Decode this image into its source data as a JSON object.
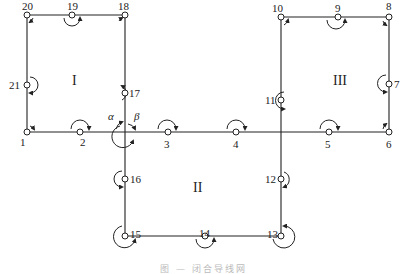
{
  "diagram": {
    "type": "closed traverse network with connection angles",
    "regions": [
      {
        "id": "I",
        "label": "I"
      },
      {
        "id": "II",
        "label": "II"
      },
      {
        "id": "III",
        "label": "III"
      }
    ],
    "points": [
      {
        "id": "1",
        "label": "1"
      },
      {
        "id": "2",
        "label": "2"
      },
      {
        "id": "3",
        "label": "3"
      },
      {
        "id": "4",
        "label": "4"
      },
      {
        "id": "5",
        "label": "5"
      },
      {
        "id": "6",
        "label": "6"
      },
      {
        "id": "7",
        "label": "7"
      },
      {
        "id": "8",
        "label": "8"
      },
      {
        "id": "9",
        "label": "9"
      },
      {
        "id": "10",
        "label": "10"
      },
      {
        "id": "11",
        "label": "11"
      },
      {
        "id": "12",
        "label": "12"
      },
      {
        "id": "13",
        "label": "13"
      },
      {
        "id": "14",
        "label": "14"
      },
      {
        "id": "15",
        "label": "15"
      },
      {
        "id": "16",
        "label": "16"
      },
      {
        "id": "17",
        "label": "17"
      },
      {
        "id": "18",
        "label": "18"
      },
      {
        "id": "19",
        "label": "19"
      },
      {
        "id": "20",
        "label": "20"
      },
      {
        "id": "21",
        "label": "21"
      }
    ],
    "angle_labels": {
      "alpha": "α",
      "beta": "β"
    },
    "line_color": "#222222",
    "caption": "图 — 闭合导线网"
  }
}
